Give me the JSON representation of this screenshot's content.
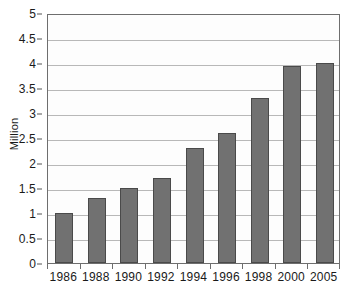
{
  "chart_data": {
    "type": "bar",
    "title": "",
    "xlabel": "",
    "ylabel": "Million",
    "categories": [
      "1986",
      "1988",
      "1990",
      "1992",
      "1994",
      "1996",
      "1998",
      "2000",
      "2005"
    ],
    "values": [
      1.0,
      1.3,
      1.5,
      1.7,
      2.3,
      2.6,
      3.3,
      3.95,
      4.0
    ],
    "ylim": [
      0,
      5
    ],
    "ytick_labels": [
      "0",
      "0.5",
      "1",
      "1.5",
      "2",
      "2.5",
      "3",
      "3.5",
      "4",
      "4.5",
      "5"
    ],
    "ytick_values": [
      0,
      0.5,
      1,
      1.5,
      2,
      2.5,
      3,
      3.5,
      4,
      4.5,
      5
    ],
    "grid": true,
    "legend": "none",
    "series": [
      {
        "name": "Million",
        "values": [
          1.0,
          1.3,
          1.5,
          1.7,
          2.3,
          2.6,
          3.3,
          3.95,
          4.0
        ]
      }
    ],
    "colors": {
      "bar_fill": "#717171",
      "bar_stroke": "#4a4a4a",
      "gridline": "#b8b8b8",
      "axis": "#6e6e6e",
      "text": "#1a1a1a",
      "plot_background": "#fdfdfd"
    }
  }
}
